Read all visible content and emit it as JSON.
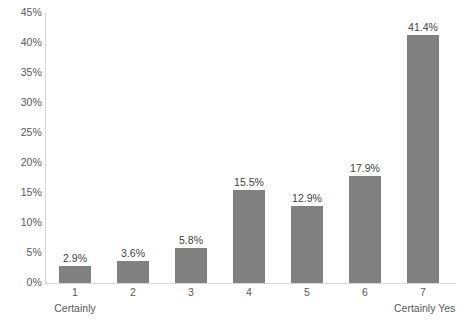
{
  "chart_data": {
    "type": "bar",
    "title": "",
    "subtitle": "",
    "xlabel": "",
    "ylabel": "",
    "categories": [
      "1",
      "2",
      "3",
      "4",
      "5",
      "6",
      "7"
    ],
    "values": [
      2.9,
      3.6,
      5.8,
      15.5,
      12.9,
      17.9,
      41.4
    ],
    "data_labels": [
      "2.9%",
      "3.6%",
      "5.8%",
      "15.5%",
      "12.9%",
      "17.9%",
      "41.4%"
    ],
    "category_sub_labels": [
      "Certainly",
      "",
      "",
      "",
      "",
      "",
      "Certainly Yes"
    ],
    "ylim": [
      0,
      45
    ],
    "ytick_step": 5,
    "ytick_labels": [
      "45%",
      "40%",
      "35%",
      "30%",
      "25%",
      "20%",
      "15%",
      "10%",
      "5%",
      "0%"
    ],
    "ytick_values": [
      45,
      40,
      35,
      30,
      25,
      20,
      15,
      10,
      5,
      0
    ],
    "grid": false,
    "legend": false,
    "legend_position": "none",
    "bar_color": "#808080",
    "axis_color": "#d9d9d9",
    "label_color": "#595959",
    "background_color": "#ffffff"
  }
}
